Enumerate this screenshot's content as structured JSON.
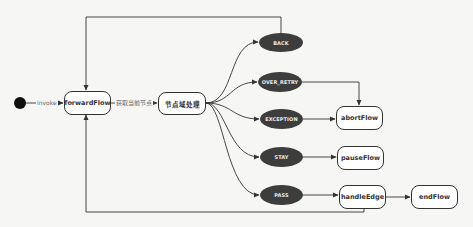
{
  "diagram": {
    "type": "state-flow",
    "start": {
      "label": ""
    },
    "nodes": {
      "forwardFlow": "forwardFlow",
      "nodeDomain": "节点域处理",
      "abortFlow": "abortFlow",
      "pauseFlow": "pauseFlow",
      "handleEdge": "handleEdge",
      "endFlow": "endFlow"
    },
    "states": {
      "back": "BACK",
      "over_retry": "OVER_RETRY",
      "exception": "EXCEPTION",
      "stay": "STAY",
      "pass": "PASS"
    },
    "edge_labels": {
      "invoke": "invoke",
      "get_current_node": "获取当前节点"
    },
    "edges": [
      {
        "from": "start",
        "to": "forwardFlow",
        "label": "invoke"
      },
      {
        "from": "forwardFlow",
        "to": "节点域处理",
        "label": "获取当前节点"
      },
      {
        "from": "节点域处理",
        "to": "BACK"
      },
      {
        "from": "节点域处理",
        "to": "OVER_RETRY"
      },
      {
        "from": "节点域处理",
        "to": "EXCEPTION"
      },
      {
        "from": "节点域处理",
        "to": "STAY"
      },
      {
        "from": "节点域处理",
        "to": "PASS"
      },
      {
        "from": "BACK",
        "to": "forwardFlow"
      },
      {
        "from": "OVER_RETRY",
        "to": "abortFlow"
      },
      {
        "from": "EXCEPTION",
        "to": "abortFlow"
      },
      {
        "from": "STAY",
        "to": "pauseFlow"
      },
      {
        "from": "PASS",
        "to": "handleEdge"
      },
      {
        "from": "handleEdge",
        "to": "endFlow"
      },
      {
        "from": "handleEdge",
        "to": "forwardFlow"
      }
    ],
    "colors": {
      "background": "#f6f6f4",
      "state_fill": "#3d3d3d",
      "state_text": "#eaeaea",
      "line": "#333333",
      "node_fill": "#ffffff"
    }
  }
}
